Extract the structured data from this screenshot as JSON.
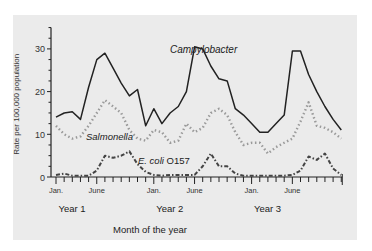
{
  "chart_data": {
    "type": "line",
    "title": "",
    "xlabel": "Month of the year",
    "ylabel": "Rate per 100,000 population",
    "ylim": [
      0,
      35
    ],
    "yticks": [
      0,
      10,
      20,
      30
    ],
    "grid": false,
    "legend_position": "inline labels",
    "x_tick_labels": [
      "Jan.",
      "June",
      "Jan.",
      "June",
      "Jan.",
      "June"
    ],
    "year_labels": [
      "Year 1",
      "Year 2",
      "Year 3"
    ],
    "months": 36,
    "series": [
      {
        "name": "Campylobacter",
        "style": "solid",
        "color": "#222222",
        "values": [
          14,
          15,
          15.3,
          13.5,
          21,
          27.5,
          29,
          25.5,
          22,
          19,
          20.5,
          12,
          16,
          12.5,
          15,
          16.5,
          20,
          30.5,
          30,
          26,
          23,
          22.5,
          16,
          14.5,
          12.5,
          10.5,
          10.5,
          12.5,
          14.5,
          29.5,
          29.5,
          24,
          20,
          16.5,
          13.5,
          11
        ]
      },
      {
        "name": "Salmonella",
        "style": "dotted",
        "color": "#9a9a9a",
        "values": [
          12,
          10,
          9,
          9.5,
          12,
          15,
          18,
          16.5,
          15,
          11,
          9,
          8.5,
          11,
          10.5,
          8,
          8.5,
          12.5,
          10.5,
          11.5,
          15,
          16,
          14.5,
          10.5,
          7.5,
          8,
          8,
          5.5,
          7,
          8,
          9,
          13,
          17.5,
          12,
          11.5,
          10.5,
          9
        ]
      },
      {
        "name": "E. coli O157",
        "style": "dash-dot",
        "color": "#444444",
        "values": [
          0.5,
          0.8,
          0.3,
          0.3,
          0.3,
          1.5,
          5,
          4.5,
          5,
          6,
          3,
          1.2,
          0.5,
          0.3,
          0.5,
          0.5,
          0.5,
          0.5,
          2.5,
          5.5,
          2.5,
          2.5,
          0.8,
          0.3,
          0.3,
          0.3,
          0.3,
          0.3,
          0.3,
          0.5,
          1.5,
          4.8,
          4,
          5.5,
          2,
          0.5
        ]
      }
    ]
  },
  "labels": {
    "campylobacter": "Campylobacter",
    "salmonella": "Salmonella",
    "ecoli_italic": "E. coli",
    "ecoli_strain": "O157"
  }
}
